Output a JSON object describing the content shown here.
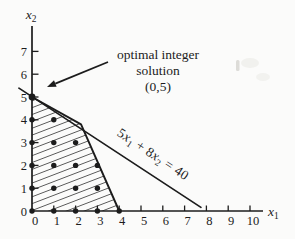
{
  "figure": {
    "background": "#fbfbfa",
    "ink": "#1c1c1c",
    "hatch_color": "#2b2b2b"
  },
  "chart_data": {
    "type": "scatter",
    "title": "",
    "xlabel": "x1",
    "ylabel": "x2",
    "xlabel_parts": [
      {
        "text": "x",
        "italic": true
      },
      {
        "text": "1",
        "sub": true
      }
    ],
    "ylabel_parts": [
      {
        "text": "x",
        "italic": true
      },
      {
        "text": "2",
        "sub": true
      }
    ],
    "xlim": [
      0,
      10
    ],
    "ylim": [
      0,
      7
    ],
    "x_ticks": [
      0,
      1,
      2,
      3,
      4,
      5,
      6,
      7,
      8,
      9,
      10
    ],
    "y_ticks": [
      0,
      1,
      2,
      3,
      4,
      5,
      6,
      7
    ],
    "grid": false,
    "legend": null,
    "feasible_region": {
      "vertices": [
        [
          0,
          0
        ],
        [
          0,
          5
        ],
        [
          2.25,
          3.8
        ],
        [
          4,
          0
        ]
      ],
      "hatched": true
    },
    "integer_points": [
      [
        0,
        0
      ],
      [
        1,
        0
      ],
      [
        2,
        0
      ],
      [
        3,
        0
      ],
      [
        4,
        0
      ],
      [
        0,
        1
      ],
      [
        1,
        1
      ],
      [
        2,
        1
      ],
      [
        3,
        1
      ],
      [
        0,
        2
      ],
      [
        1,
        2
      ],
      [
        2,
        2
      ],
      [
        3,
        2
      ],
      [
        0,
        3
      ],
      [
        1,
        3
      ],
      [
        2,
        3
      ],
      [
        0,
        4
      ],
      [
        1,
        4
      ],
      [
        0,
        5
      ]
    ],
    "objective_line": {
      "equation": "5x₁ + 8x₂ = 40",
      "equation_parts": [
        {
          "text": "5"
        },
        {
          "text": "x",
          "italic": true
        },
        {
          "text": "1",
          "sub": true
        },
        {
          "text": " + 8"
        },
        {
          "text": "x",
          "italic": true
        },
        {
          "text": "2",
          "sub": true
        },
        {
          "text": " = 40"
        }
      ],
      "from": [
        -0.6,
        5.39
      ],
      "to": [
        7.75,
        0.16
      ],
      "label_angle_deg": 33.5
    },
    "annotation": {
      "lines": [
        "optimal integer",
        "solution",
        "(0,5)"
      ],
      "points_to": [
        0,
        5
      ]
    }
  }
}
